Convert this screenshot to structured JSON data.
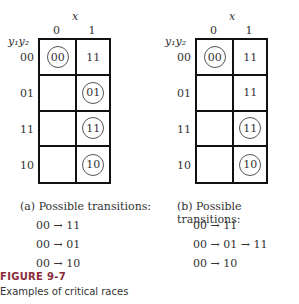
{
  "figure": {
    "number": "FIGURE 9-7",
    "caption": "Examples of critical races"
  },
  "panels": [
    {
      "id": "a",
      "x_label": "x",
      "row_var_label": "y₁y₂",
      "columns": [
        "0",
        "1"
      ],
      "rows": [
        {
          "label": "00",
          "cells": [
            {
              "value": "00",
              "stable": true
            },
            {
              "value": "11",
              "stable": false
            }
          ]
        },
        {
          "label": "01",
          "cells": [
            {
              "value": "",
              "stable": false
            },
            {
              "value": "01",
              "stable": true
            }
          ]
        },
        {
          "label": "11",
          "cells": [
            {
              "value": "",
              "stable": false
            },
            {
              "value": "11",
              "stable": true
            }
          ]
        },
        {
          "label": "10",
          "cells": [
            {
              "value": "",
              "stable": false
            },
            {
              "value": "10",
              "stable": true
            }
          ]
        }
      ],
      "caption": "(a)  Possible transitions:",
      "transitions": [
        "00 → 11",
        "00 → 01",
        "00 → 10"
      ]
    },
    {
      "id": "b",
      "x_label": "x",
      "row_var_label": "y₁y₂",
      "columns": [
        "0",
        "1"
      ],
      "rows": [
        {
          "label": "00",
          "cells": [
            {
              "value": "00",
              "stable": true
            },
            {
              "value": "11",
              "stable": false
            }
          ]
        },
        {
          "label": "01",
          "cells": [
            {
              "value": "",
              "stable": false
            },
            {
              "value": "11",
              "stable": false
            }
          ]
        },
        {
          "label": "11",
          "cells": [
            {
              "value": "",
              "stable": false
            },
            {
              "value": "11",
              "stable": true
            }
          ]
        },
        {
          "label": "10",
          "cells": [
            {
              "value": "",
              "stable": false
            },
            {
              "value": "10",
              "stable": true
            }
          ]
        }
      ],
      "caption": "(b)  Possible transitions:",
      "transitions": [
        "00 → 11",
        "00 → 01 → 11",
        "00 → 10"
      ]
    }
  ]
}
